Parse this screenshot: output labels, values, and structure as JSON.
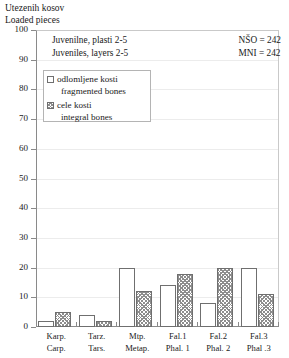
{
  "chart_data": {
    "type": "bar",
    "title": "Utezenih kosov",
    "subtitle": "Loaded pieces",
    "xlabel": "",
    "ylabel": "",
    "ylim": [
      0,
      100
    ],
    "ytick_step": 10,
    "yticks": [
      "100",
      "90",
      "80",
      "70",
      "60",
      "50",
      "40",
      "30",
      "20",
      "10",
      "0"
    ],
    "grid": true,
    "legend_position": "inside-upper-left",
    "categories": [
      {
        "sl": "Karp.",
        "en": "Carp."
      },
      {
        "sl": "Tarz.",
        "en": "Tars."
      },
      {
        "sl": "Mtp.",
        "en": "Metap."
      },
      {
        "sl": "Fal.1",
        "en": "Phal. 1"
      },
      {
        "sl": "Fal.2",
        "en": "Phal. 2"
      },
      {
        "sl": "Fal.3",
        "en": "Phal .3"
      }
    ],
    "series": [
      {
        "name": "odlomljene kosti / fragmented bones",
        "key": "fragmented",
        "values": [
          2,
          4,
          20,
          14,
          8,
          20
        ]
      },
      {
        "name": "cele kosti / integral bones",
        "key": "integral",
        "values": [
          5,
          2,
          12,
          18,
          20,
          11
        ]
      }
    ],
    "annotations": {
      "group_caption_sl": "Juvenilne, plasti 2-5",
      "group_caption_en": "Juveniles, layers 2-5",
      "stat_nso": "NŠO = 242",
      "stat_mni": "MNI = 242"
    }
  },
  "legend": {
    "entries": [
      {
        "swatch": "fragmented",
        "label_sl": "odlomljene kosti",
        "label_en": "fragmented bones"
      },
      {
        "swatch": "integral",
        "label_sl": "cele kosti",
        "label_en": "integral bones"
      }
    ]
  },
  "colors": {
    "axis": "#8a8a8a",
    "bar_outline": "#6f6f6f",
    "hatch": "#8d8d8d",
    "grid": "#ececec",
    "text": "#1a1a1a"
  }
}
